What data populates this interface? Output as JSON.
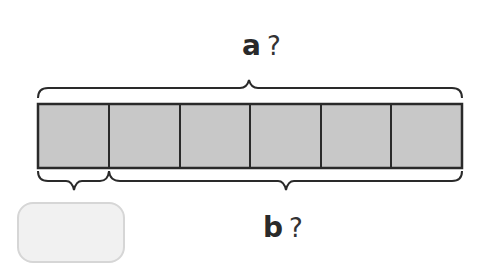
{
  "diagram": {
    "type": "tape-diagram",
    "segment_count": 6,
    "segment_fill": "#c8c8c8",
    "stroke_color": "#2a2a2a",
    "top_label": {
      "variable": "a",
      "mark": "?"
    },
    "bottom_label": {
      "variable": "b",
      "mark": "?"
    },
    "answer_box": {
      "value": ""
    }
  }
}
